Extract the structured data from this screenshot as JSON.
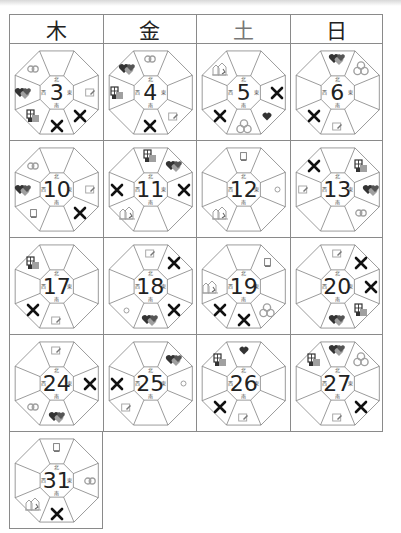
{
  "header": {
    "days": [
      {
        "label": "木",
        "key": "thu"
      },
      {
        "label": "金",
        "key": "fri"
      },
      {
        "label": "土",
        "key": "sat"
      },
      {
        "label": "日",
        "key": "sun"
      }
    ]
  },
  "compass_labels": {
    "n": "北",
    "e": "東",
    "s": "南",
    "w": "西"
  },
  "legend_icons": {
    "x": "x-mark-icon",
    "heart": "heart-icon",
    "hearts": "hearts-icon",
    "coins": "coins-icon",
    "rings": "rings-icon",
    "building": "building-icon",
    "house": "house-icon",
    "card": "card-icon",
    "book": "book-icon",
    "circle": "circle-icon"
  },
  "calendar": {
    "rows": [
      [
        {
          "day": "3",
          "icons": {
            "nw": "rings",
            "w": "hearts",
            "sw": "building",
            "s": "x",
            "se": "x",
            "e": "card"
          }
        },
        {
          "day": "4",
          "icons": {
            "n": "rings",
            "nw": "hearts",
            "w": "building",
            "s": "x",
            "se": "card"
          }
        },
        {
          "day": "5",
          "icons": {
            "nw": "house",
            "e": "x",
            "se": "heart",
            "s": "coins",
            "sw": "x"
          }
        },
        {
          "day": "6",
          "icons": {
            "n": "hearts",
            "ne": "coins",
            "sw": "x",
            "s": "card"
          }
        }
      ],
      [
        {
          "day": "10",
          "icons": {
            "nw": "rings",
            "w": "hearts",
            "e": "card",
            "se": "x",
            "sw": "book"
          }
        },
        {
          "day": "11",
          "icons": {
            "n": "building",
            "ne": "hearts",
            "w": "x",
            "e": "x",
            "sw": "house"
          }
        },
        {
          "day": "12",
          "icons": {
            "n": "book",
            "e": "circle",
            "sw": "house"
          }
        },
        {
          "day": "13",
          "icons": {
            "nw": "x",
            "ne": "building",
            "w": "card",
            "e": "hearts",
            "se": "rings"
          }
        }
      ],
      [
        {
          "day": "17",
          "icons": {
            "nw": "building",
            "sw": "x",
            "s": "card"
          }
        },
        {
          "day": "18",
          "icons": {
            "n": "card",
            "ne": "x",
            "sw": "circle",
            "s": "hearts",
            "se": "x"
          }
        },
        {
          "day": "19",
          "icons": {
            "ne": "book",
            "w": "house",
            "sw": "x",
            "s": "x",
            "se": "coins"
          }
        },
        {
          "day": "20",
          "icons": {
            "n": "card",
            "ne": "x",
            "e": "x",
            "se": "building",
            "s": "hearts"
          }
        }
      ],
      [
        {
          "day": "24",
          "icons": {
            "n": "card",
            "e": "x",
            "sw": "rings",
            "s": "hearts"
          }
        },
        {
          "day": "25",
          "icons": {
            "ne": "hearts",
            "w": "x",
            "e": "circle",
            "sw": "card"
          }
        },
        {
          "day": "26",
          "icons": {
            "nw": "building",
            "n": "heart",
            "sw": "x",
            "s": "card"
          }
        },
        {
          "day": "27",
          "icons": {
            "nw": "building",
            "n": "hearts",
            "ne": "coins",
            "se": "x",
            "s": "card"
          }
        }
      ],
      [
        {
          "day": "31",
          "icons": {
            "n": "book",
            "e": "rings",
            "sw": "house",
            "s": "x"
          }
        },
        null,
        null,
        null
      ]
    ]
  },
  "colors": {
    "grid_line": "#8a8a8a",
    "octagon_line": "#707070",
    "x_mark": "#111111",
    "icon_dark": "#333333",
    "icon_light": "#a0a0a0"
  }
}
